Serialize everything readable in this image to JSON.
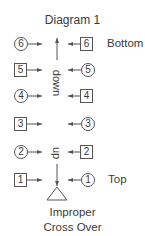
{
  "diagram": {
    "title": "Diagram 1",
    "labels": {
      "bottom": "Bottom",
      "top": "Top"
    },
    "center": {
      "down": "down",
      "up": "up"
    },
    "caption": {
      "line1": "Improper",
      "line2": "Cross Over"
    },
    "rows": [
      {
        "left": {
          "shape": "circle",
          "value": "6"
        },
        "right": {
          "shape": "square",
          "value": "6"
        }
      },
      {
        "left": {
          "shape": "square",
          "value": "5"
        },
        "right": {
          "shape": "circle",
          "value": "5"
        }
      },
      {
        "left": {
          "shape": "circle",
          "value": "4"
        },
        "right": {
          "shape": "square",
          "value": "4"
        }
      },
      {
        "left": {
          "shape": "square",
          "value": "3"
        },
        "right": {
          "shape": "circle",
          "value": "3"
        }
      },
      {
        "left": {
          "shape": "circle",
          "value": "2"
        },
        "right": {
          "shape": "square",
          "value": "2"
        }
      },
      {
        "left": {
          "shape": "square",
          "value": "1"
        },
        "right": {
          "shape": "circle",
          "value": "1"
        }
      }
    ],
    "colors": {
      "stroke": "#555555",
      "text": "#3a3a3a"
    }
  }
}
